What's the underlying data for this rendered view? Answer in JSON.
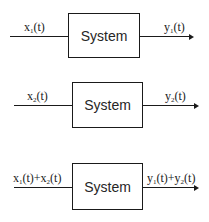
{
  "diagram": {
    "rows": [
      {
        "block_label": "System",
        "input": {
          "base": "x",
          "sub": "1",
          "rest": "(t)"
        },
        "output": {
          "base": "y",
          "sub": "1",
          "rest": "(t)"
        }
      },
      {
        "block_label": "System",
        "input": {
          "base": "x",
          "sub": "2",
          "rest": "(t)"
        },
        "output": {
          "base": "y",
          "sub": "2",
          "rest": "(t)"
        }
      },
      {
        "block_label": "System",
        "input": {
          "a_base": "x",
          "a_sub": "1",
          "a_rest": "(t)+",
          "b_base": "x",
          "b_sub": "2",
          "b_rest": "(t)"
        },
        "output": {
          "a_base": "y",
          "a_sub": "1",
          "a_rest": "(t)+",
          "b_base": "y",
          "b_sub": "2",
          "b_rest": "(t)"
        }
      }
    ]
  }
}
